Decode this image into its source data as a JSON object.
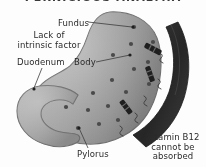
{
  "figure": {
    "title": "PERNICIOUS ANAEMIA",
    "style": "grayscale-medical-illustration"
  },
  "labels": {
    "fundus": "Fundus",
    "lack_of_intrinsic_factor": "Lack of\nintrinsic factor",
    "lack_line1": "Lack of",
    "lack_line2": "intrinsic factor",
    "duodenum": "Duodenum",
    "body": "Body",
    "pylorus": "Pylorus",
    "vitamin_b12_line1": "Vitamin B12",
    "vitamin_b12_line2": "cannot be",
    "vitamin_b12_line3": "absorbed",
    "vitamin_b12_full": "Vitamin B12 cannot be absorbed"
  },
  "colors": {
    "background": "#fdfdfd",
    "stomach_fill": "#9a9a9a",
    "stomach_fill_light": "#b4b4b4",
    "stomach_outline": "#6e6e6e",
    "duodenum_fill": "#a8a8a8",
    "dot": "#4a4a4a",
    "blocked_band": "#2e2e2e",
    "marker": "#1f1f1f",
    "text": "#2b2b2b",
    "leader_line": "#3c3c3c",
    "title_text": "#3a3a3a"
  },
  "anatomy": {
    "parts": [
      {
        "name": "fundus",
        "label": "Fundus"
      },
      {
        "name": "body",
        "label": "Body"
      },
      {
        "name": "duodenum",
        "label": "Duodenum"
      },
      {
        "name": "pylorus",
        "label": "Pylorus"
      }
    ]
  },
  "annotations": [
    {
      "name": "lack-of-intrinsic-factor",
      "text": "Lack of intrinsic factor",
      "position": "upper-left"
    },
    {
      "name": "vitamin-b12-not-absorbed",
      "text": "Vitamin B12 cannot be absorbed",
      "position": "lower-right"
    }
  ],
  "graphics": {
    "dot_count": 14,
    "marker_count": 3,
    "blocked_band_description": "thick dark curved band along right side indicating blocked absorption"
  }
}
